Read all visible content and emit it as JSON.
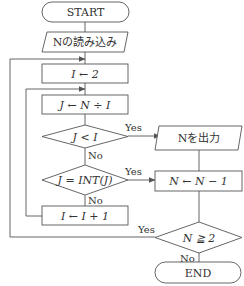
{
  "flowchart": {
    "start": "START",
    "input": "Nの読み込み",
    "init_i": "I ← 2",
    "compute_j": "J ← N ÷ I",
    "decision_j_lt_i": "J < I",
    "output_n": "Nを出力",
    "decision_j_int": "J = INT(J)",
    "decrement_n": "N ← N − 1",
    "increment_i": "I ← I + 1",
    "decision_n_ge_2": "N ≧ 2",
    "end": "END",
    "yes_label": "Yes",
    "no_label": "No"
  }
}
